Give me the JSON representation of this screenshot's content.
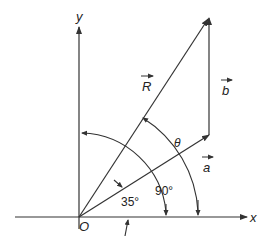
{
  "diagram": {
    "axes": {
      "x_label": "x",
      "y_label": "y",
      "origin_label": "O"
    },
    "vectors": [
      {
        "name": "a",
        "label": "a",
        "from": "O",
        "direction_deg": 35
      },
      {
        "name": "b",
        "label": "b",
        "from": "tip of a",
        "direction_deg": 90
      },
      {
        "name": "R",
        "label": "R",
        "from": "O",
        "to": "tip of b"
      }
    ],
    "angles": [
      {
        "label": "35°",
        "between": [
          "x-axis",
          "a"
        ]
      },
      {
        "label": "90°",
        "between": [
          "x-axis",
          "y-axis"
        ]
      },
      {
        "label": "θ",
        "between": [
          "x-axis",
          "R"
        ]
      }
    ],
    "colors": {
      "line": "#333333",
      "background": "#ffffff"
    }
  }
}
